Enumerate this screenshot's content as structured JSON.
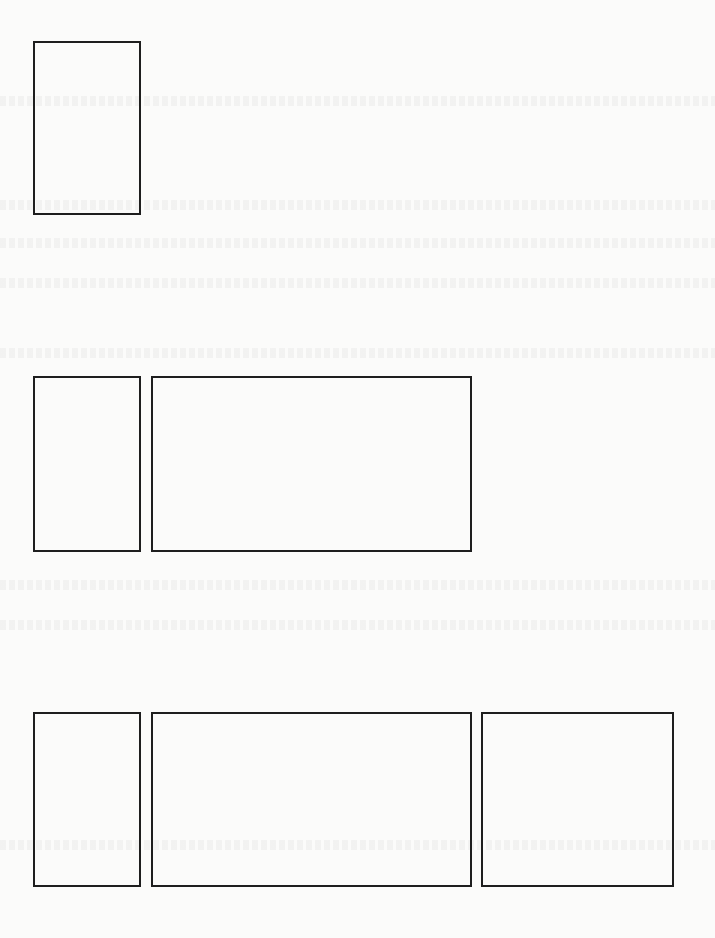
{
  "page": {
    "background": "#fbfbfa",
    "border_color": "#1e1e1e",
    "rows": [
      {
        "boxes": [
          {
            "x": 33,
            "y": 41,
            "w": 108,
            "h": 174
          }
        ]
      },
      {
        "boxes": [
          {
            "x": 33,
            "y": 376,
            "w": 108,
            "h": 176
          },
          {
            "x": 151,
            "y": 376,
            "w": 321,
            "h": 176
          }
        ]
      },
      {
        "boxes": [
          {
            "x": 33,
            "y": 712,
            "w": 108,
            "h": 175
          },
          {
            "x": 151,
            "y": 712,
            "w": 321,
            "h": 175
          },
          {
            "x": 481,
            "y": 712,
            "w": 193,
            "h": 175
          }
        ]
      }
    ]
  }
}
